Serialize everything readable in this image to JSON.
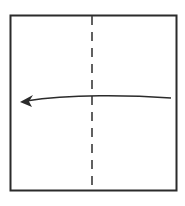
{
  "diagram": {
    "type": "origami-fold-step",
    "paper": {
      "shape": "square",
      "fill": "#ffffff",
      "stroke": "#2b2b2b"
    },
    "fold_line": {
      "style": "dashed",
      "orientation": "vertical",
      "kind": "valley-fold",
      "color": "#3a3a3a"
    },
    "arrow": {
      "direction": "left",
      "meaning": "fold right half over to the left",
      "color": "#2b2b2b"
    }
  }
}
